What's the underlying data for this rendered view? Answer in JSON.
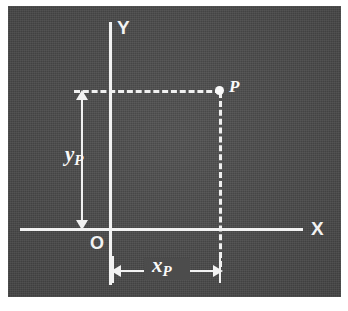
{
  "figure": {
    "kind": "cartesian-coordinate-diagram",
    "background_color": "#ffffff",
    "panel_color": "#4c4c4c",
    "ink_color": "#f2f2f2"
  },
  "axes": {
    "x_label": "X",
    "y_label": "Y",
    "origin_label": "O"
  },
  "point": {
    "label": "P",
    "marker": "filled-dot"
  },
  "dimensions": {
    "vertical": {
      "symbol": "y",
      "subscript": "P",
      "meaning": "y-coordinate of point P"
    },
    "horizontal": {
      "symbol": "x",
      "subscript": "P",
      "meaning": "x-coordinate of point P"
    }
  },
  "chart_data": {
    "type": "scatter",
    "title": "",
    "xlabel": "X",
    "ylabel": "Y",
    "grid": false,
    "legend": null,
    "annotations": [
      "O",
      "P",
      "x_P",
      "y_P"
    ],
    "points": [
      {
        "name": "P",
        "x_label": "x_P",
        "y_label": "y_P"
      }
    ],
    "guides": [
      {
        "style": "dashed",
        "from": "y-axis",
        "to": "P",
        "orientation": "horizontal"
      },
      {
        "style": "dashed",
        "from": "P",
        "to": "x-axis",
        "orientation": "vertical"
      }
    ]
  }
}
